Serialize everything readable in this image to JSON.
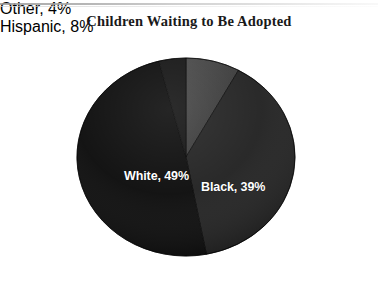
{
  "chart_data": {
    "type": "pie",
    "title": "Children Waiting to Be Adopted",
    "categories": [
      "Hispanic",
      "Black",
      "White",
      "Other"
    ],
    "values": [
      8,
      39,
      49,
      4
    ],
    "labels": [
      "Hispanic, 8%",
      "Black, 39%",
      "White, 49%",
      "Other, 4%"
    ],
    "slice_colors": [
      "#3d3d3d",
      "#232323",
      "#0d0d0d",
      "#151515"
    ],
    "label_positions": [
      "outside",
      "inside",
      "inside",
      "outside"
    ],
    "label_text_colors": [
      "#111111",
      "#ffffff",
      "#ffffff",
      "#111111"
    ],
    "start_angle_deg": 0,
    "direction": "clockwise",
    "legend": "none",
    "grid": false,
    "xlabel": "",
    "ylabel": "",
    "units": "percent",
    "total": 100
  },
  "chart": {
    "title": "Children Waiting to Be Adopted",
    "background_color": "#ffffff",
    "slices": [
      {
        "name": "hispanic",
        "label": "Hispanic, 8%",
        "category": "Hispanic",
        "value": 8,
        "color": "#3d3d3d"
      },
      {
        "name": "black",
        "label": "Black, 39%",
        "category": "Black",
        "value": 39,
        "color": "#232323"
      },
      {
        "name": "white",
        "label": "White, 49%",
        "category": "White",
        "value": 49,
        "color": "#0d0d0d"
      },
      {
        "name": "other",
        "label": "Other, 4%",
        "category": "Other",
        "value": 4,
        "color": "#151515"
      }
    ]
  }
}
